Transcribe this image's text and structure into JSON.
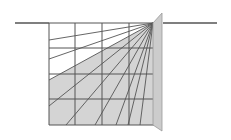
{
  "diagram": {
    "type": "perspective-projection",
    "colors": {
      "background": "#ffffff",
      "line": "#555555",
      "shade": "#d4d4d4",
      "plane": "#cccccc"
    },
    "horizon": {
      "left": [
        15,
        23,
        49,
        23
      ],
      "right": [
        163,
        23,
        217,
        23
      ]
    },
    "grid": {
      "x": [
        49,
        75,
        102,
        129,
        154
      ],
      "y": [
        23,
        48,
        74,
        99,
        125
      ]
    },
    "vanishing_point": [
      153,
      23
    ],
    "shaded_region": "49,80 49,125 154,125 154,23 153,23",
    "plane": "153,23 162,13 162,131 153,125",
    "rays": [
      [
        49,
        40
      ],
      [
        49,
        59
      ],
      [
        49,
        80
      ],
      [
        49,
        106
      ],
      [
        66,
        125
      ],
      [
        95,
        125
      ],
      [
        116,
        125
      ],
      [
        128,
        125
      ],
      [
        140,
        125
      ]
    ]
  }
}
